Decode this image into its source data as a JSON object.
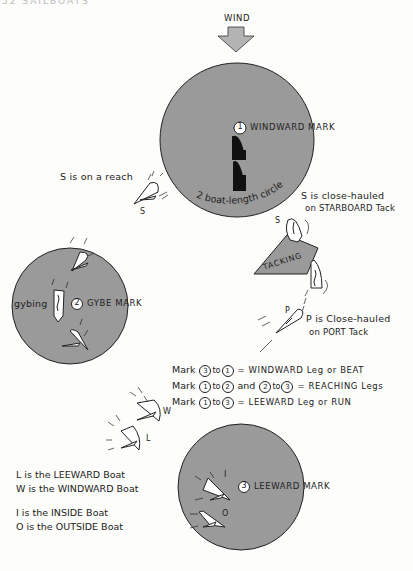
{
  "page_header": "52 SAILBOATS",
  "wind": {
    "label": "WIND",
    "icon": "down-arrow-hatched"
  },
  "marks": [
    {
      "number": "1",
      "label": "WINDWARD MARK"
    },
    {
      "number": "2",
      "label": "GYBE MARK"
    },
    {
      "number": "3",
      "label": "LEEWARD MARK"
    }
  ],
  "circle_label": "2 boat-length circle",
  "annotations": {
    "s_reach": "S is on a reach",
    "s_reach_boat": "S",
    "s_closehauled_line1": "S is close-hauled",
    "s_closehauled_line2": "on STARBOARD Tack",
    "s_tack_boat": "S",
    "tacking": "TACKING",
    "p_boat": "P",
    "p_closehauled_line1": "P is Close-hauled",
    "p_closehauled_line2": "on PORT Tack",
    "gybing": "gybing",
    "w_boat": "W",
    "l_boat": "L",
    "i_boat": "I",
    "o_boat": "O"
  },
  "legs": [
    {
      "prefix": "Mark",
      "from": "3",
      "mid": "to",
      "to": "1",
      "suffix": "= WINDWARD Leg or BEAT"
    },
    {
      "prefix": "Mark",
      "from": "1",
      "mid": "to",
      "to": "2",
      "and": "and",
      "from2": "2",
      "mid2": "to",
      "to2": "3",
      "suffix": "= REACHING Legs"
    },
    {
      "prefix": "Mark",
      "from": "1",
      "mid": "to",
      "to": "3",
      "suffix": "= LEEWARD Leg or RUN"
    }
  ],
  "legend": [
    "L is the LEEWARD Boat",
    "W is the WINDWARD Boat",
    "I is the INSIDE Boat",
    "O is the OUTSIDE Boat"
  ],
  "colors": {
    "circle_fill": "#9a9a9a",
    "ink": "#222222",
    "paper": "#fdfdfb",
    "boat_black": "#111111"
  }
}
